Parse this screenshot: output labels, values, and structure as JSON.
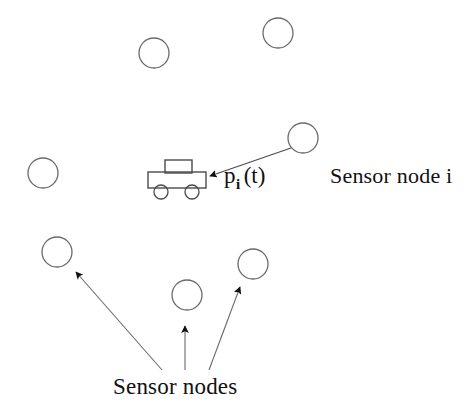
{
  "figure": {
    "background_color": "#ffffff",
    "stroke_color": "#555555",
    "text_color": "#111111",
    "width": 474,
    "height": 410
  },
  "labels": {
    "sensor_node_i": "Sensor node i",
    "sensor_nodes": "Sensor nodes",
    "position_symbol": "p",
    "position_subscript": "i",
    "position_argument": "(t)"
  },
  "nodes": [
    {
      "id": "node-1",
      "cx": 154,
      "cy": 53,
      "r": 15
    },
    {
      "id": "node-2",
      "cx": 278,
      "cy": 33,
      "r": 15
    },
    {
      "id": "node-3",
      "cx": 43,
      "cy": 173,
      "r": 15
    },
    {
      "id": "node-4",
      "cx": 303,
      "cy": 138,
      "r": 15
    },
    {
      "id": "node-5",
      "cx": 57,
      "cy": 252,
      "r": 15
    },
    {
      "id": "node-6",
      "cx": 187,
      "cy": 295,
      "r": 15
    },
    {
      "id": "node-7",
      "cx": 253,
      "cy": 264,
      "r": 15
    }
  ],
  "robot": {
    "id": "mobile-robot",
    "body": {
      "x": 148,
      "y": 172,
      "width": 58,
      "height": 16
    },
    "turret": {
      "x": 165,
      "y": 160,
      "width": 27,
      "height": 13
    },
    "wheels": [
      {
        "cx": 161,
        "cy": 192,
        "r": 7
      },
      {
        "cx": 192,
        "cy": 192,
        "r": 7
      }
    ]
  },
  "arrows": [
    {
      "id": "arrow-node-i-to-robot",
      "x1": 291,
      "y1": 148,
      "x2": 208,
      "y2": 176
    },
    {
      "id": "arrow-caption-to-node-5",
      "x1": 162,
      "y1": 370,
      "x2": 74,
      "y2": 271
    },
    {
      "id": "arrow-caption-to-node-6",
      "x1": 185,
      "y1": 370,
      "x2": 185,
      "y2": 327
    },
    {
      "id": "arrow-caption-to-node-7",
      "x1": 209,
      "y1": 370,
      "x2": 239,
      "y2": 288
    }
  ]
}
